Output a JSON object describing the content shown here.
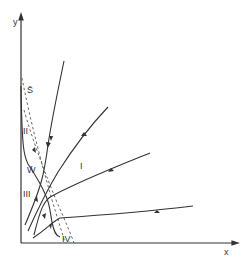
{
  "diagram": {
    "type": "phase-portrait",
    "axes": {
      "x_label": "x",
      "y_label": "y"
    },
    "region_labels": {
      "I": "I",
      "II": "II",
      "III": "III",
      "IV": "IV"
    },
    "curve_labels": {
      "S": "S̄",
      "W": "W̄"
    },
    "colors": {
      "line": "#333333",
      "background": "#ffffff"
    }
  }
}
